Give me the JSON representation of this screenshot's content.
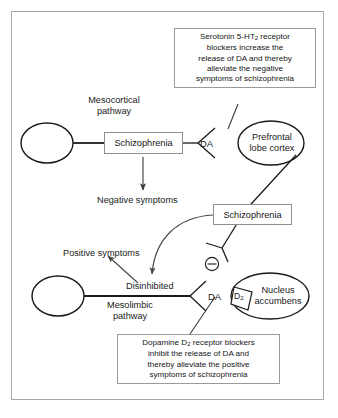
{
  "figure": {
    "frame_color": "#a8a8a8",
    "ink_color": "#1a1a1a",
    "background": "#ffffff"
  },
  "pathways": {
    "mesocortical": {
      "name_line1": "Mesocortical",
      "name_line2": "pathway"
    },
    "mesolimbic": {
      "name_line1": "Mesolimbic",
      "name_line2": "pathway"
    }
  },
  "nodes": {
    "schizophrenia_top": "Schizophrenia",
    "schizophrenia_bottom": "Schizophrenia",
    "negative_symptoms": "Negative symptoms",
    "positive_symptoms": "Positive symptoms",
    "disinhibited": "Disinhibited",
    "prefrontal_line1": "Prefrontal",
    "prefrontal_line2": "lobe cortex",
    "nucleus_line1": "Nucleus",
    "nucleus_line2": "accumbens"
  },
  "labels": {
    "da_top": "DA",
    "da_bottom": "DA",
    "d2_receptor": "D",
    "d2_subscript": "2",
    "minus_sign": "⊖"
  },
  "annotations": {
    "serotonin_note": {
      "line1_prefix": "Serotonin 5-HT",
      "line1_sub": "2",
      "line1_suffix": " receptor",
      "line2": "blockers increase the",
      "line3": "release of DA and thereby",
      "line4": "alleviate the negative",
      "line5": "symptoms of schizophrenia"
    },
    "dopamine_note": {
      "line1_prefix": "Dopamine D",
      "line1_sub": "2",
      "line1_suffix": " receptor blockers",
      "line2": "inhibit the release of DA and",
      "line3": "thereby alleviate the positive",
      "line4": "symptoms of schizophrenia"
    }
  }
}
